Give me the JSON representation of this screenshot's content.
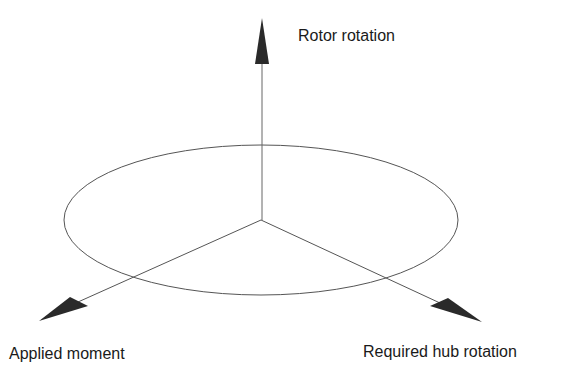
{
  "diagram": {
    "labels": {
      "rotor_rotation": "Rotor rotation",
      "applied_moment": "Applied moment",
      "required_hub_rotation": "Required hub rotation"
    },
    "colors": {
      "line": "#555555",
      "arrowhead": "#2a2a2a",
      "text": "#1a1a1a",
      "background": "#ffffff"
    },
    "elements": {
      "ellipse": "rotor-disk-ellipse",
      "axes": [
        "vertical-axis-arrow",
        "left-axis-arrow",
        "right-axis-arrow"
      ]
    }
  }
}
